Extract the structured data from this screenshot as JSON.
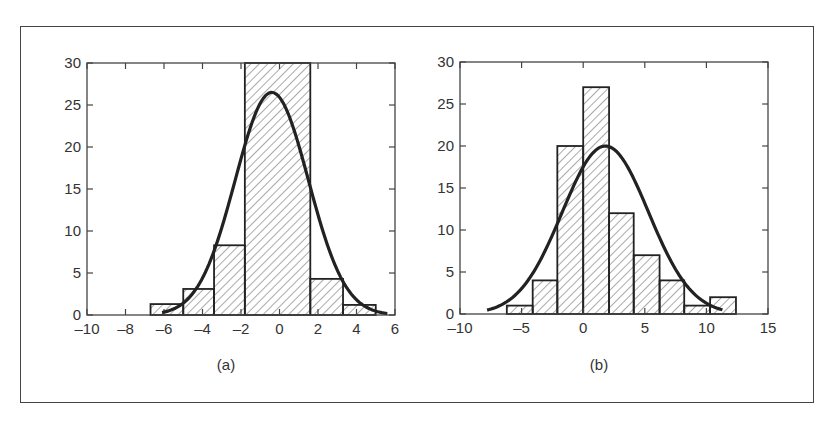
{
  "chart_data": [
    {
      "type": "bar",
      "subtype": "histogram_with_normal_fit",
      "caption": "(a)",
      "title": "",
      "xlabel": "",
      "ylabel": "",
      "xlim": [
        -10,
        6
      ],
      "ylim": [
        0,
        30
      ],
      "xticks": [
        -10,
        -8,
        -6,
        -4,
        -2,
        0,
        2,
        4,
        6
      ],
      "yticks": [
        0,
        5,
        10,
        15,
        20,
        25,
        30
      ],
      "grid": false,
      "bin_edges": [
        -6.7,
        -5.0,
        -3.4,
        -1.8,
        1.6,
        3.3,
        5.0
      ],
      "values": [
        1.3,
        3.1,
        8.3,
        30,
        4.3,
        1.2
      ],
      "fit_curve": {
        "type": "normal",
        "peak": 26.5,
        "mean": -0.4,
        "sd": 1.9,
        "x_range": [
          -6.1,
          5.6
        ]
      },
      "fill": "diagonal-hatch"
    },
    {
      "type": "bar",
      "subtype": "histogram_with_normal_fit",
      "caption": "(b)",
      "title": "",
      "xlabel": "",
      "ylabel": "",
      "xlim": [
        -10,
        15
      ],
      "ylim": [
        0,
        30
      ],
      "xticks": [
        -10,
        -5,
        0,
        5,
        10,
        15
      ],
      "yticks": [
        0,
        5,
        10,
        15,
        20,
        25,
        30
      ],
      "grid": false,
      "bin_edges": [
        -6.2,
        -4.1,
        -2.1,
        0,
        2.1,
        4.1,
        6.2,
        8.2,
        10.3,
        12.4
      ],
      "values": [
        1,
        4,
        20,
        27,
        12,
        7,
        4,
        1,
        2
      ],
      "fit_curve": {
        "type": "normal",
        "peak": 20,
        "mean": 1.8,
        "sd": 3.5,
        "x_range": [
          -7.8,
          11.3
        ]
      },
      "fill": "diagonal-hatch"
    }
  ],
  "colors": {
    "line": "#222222",
    "axis": "#444444",
    "hatch": "#555555",
    "text": "#333333"
  }
}
